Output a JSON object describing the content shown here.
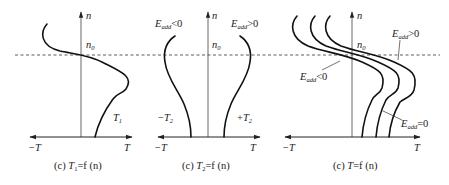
{
  "figure": {
    "reference_line": {
      "label": "n",
      "label_sub": "0",
      "style": "dashed"
    },
    "axes": {
      "vertical_label": "n",
      "horizontal_neg_label": "−T",
      "horizontal_pos_label": "T"
    },
    "panels": [
      {
        "id": "T1",
        "caption_prefix": "(c) ",
        "caption_var": "T",
        "caption_sub": "1",
        "caption_rest": "=f (n)",
        "curve_label_var": "T",
        "curve_label_sub": "1"
      },
      {
        "id": "T2",
        "caption_prefix": "(c) ",
        "caption_var": "T",
        "caption_sub": "2",
        "caption_rest": "=f (n)",
        "left_curve": {
          "label_prefix": "−",
          "label_var": "T",
          "label_sub": "2",
          "condition_var": "E",
          "condition_sub": "add",
          "condition_rel": "<0"
        },
        "right_curve": {
          "label_prefix": "+",
          "label_var": "T",
          "label_sub": "2",
          "condition_var": "E",
          "condition_sub": "add",
          "condition_rel": ">0"
        }
      },
      {
        "id": "T",
        "caption_prefix": "(c) ",
        "caption_var": "T",
        "caption_sub": "",
        "caption_rest": "=f (n)",
        "annotations": [
          {
            "var": "E",
            "sub": "add",
            "rel": ">0"
          },
          {
            "var": "E",
            "sub": "add",
            "rel": "<0"
          },
          {
            "var": "E",
            "sub": "add",
            "rel": "=0"
          }
        ]
      }
    ]
  }
}
